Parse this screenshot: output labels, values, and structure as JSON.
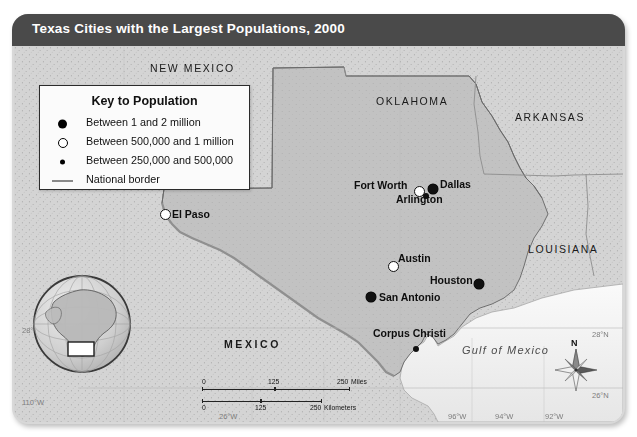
{
  "title": "Texas Cities with the Largest Populations, 2000",
  "legend": {
    "heading": "Key to Population",
    "items": [
      {
        "symbol": "large-filled-circle",
        "label": "Between 1 and 2 million"
      },
      {
        "symbol": "hollow-circle",
        "label": "Between 500,000 and 1 million"
      },
      {
        "symbol": "small-filled-circle",
        "label": "Between 250,000 and 500,000"
      },
      {
        "symbol": "gray-line",
        "label": "National border"
      }
    ]
  },
  "cities": [
    {
      "name": "El Paso",
      "symbol": "hollow-circle",
      "label_position": "right"
    },
    {
      "name": "Fort Worth",
      "symbol": "hollow-circle",
      "label_position": "left"
    },
    {
      "name": "Dallas",
      "symbol": "large-filled-circle",
      "label_position": "right"
    },
    {
      "name": "Arlington",
      "symbol": "small-filled-circle",
      "label_position": "below"
    },
    {
      "name": "Austin",
      "symbol": "hollow-circle",
      "label_position": "right"
    },
    {
      "name": "Houston",
      "symbol": "large-filled-circle",
      "label_position": "left"
    },
    {
      "name": "San Antonio",
      "symbol": "large-filled-circle",
      "label_position": "right"
    },
    {
      "name": "Corpus Christi",
      "symbol": "small-filled-circle",
      "label_position": "left"
    }
  ],
  "regions": [
    {
      "name": "NEW MEXICO"
    },
    {
      "name": "OKLAHOMA"
    },
    {
      "name": "ARKANSAS"
    },
    {
      "name": "LOUISIANA"
    },
    {
      "name": "MEXICO"
    }
  ],
  "water": {
    "name": "Gulf of Mexico"
  },
  "scale": {
    "miles": {
      "ticks": [
        "0",
        "125",
        "250"
      ],
      "unit": "Miles"
    },
    "kilometers": {
      "ticks": [
        "0",
        "125",
        "250"
      ],
      "unit": "Kilometers"
    }
  },
  "compass": {
    "north": "N"
  },
  "graticule": {
    "left": [
      "28°N",
      "110°W"
    ],
    "right": [
      "28°N",
      "26°N"
    ],
    "bottom": [
      "26°W",
      "96°W",
      "94°W",
      "92°W"
    ]
  },
  "colors": {
    "title_bar": "#4a4a4a",
    "land": "#cfcfcf",
    "texas": "#bfbfbf",
    "water": "#f2f2f2",
    "border": "#8a8a8a"
  }
}
